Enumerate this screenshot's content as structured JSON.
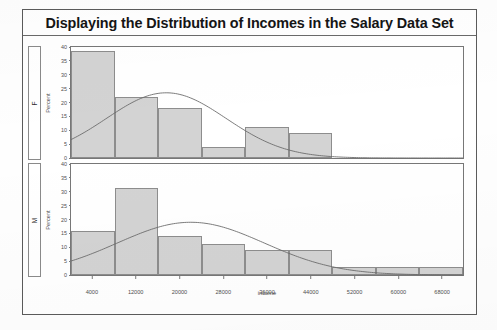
{
  "title": "Displaying the Distribution of Incomes in the Salary Data Set",
  "axis": {
    "x_title": "income",
    "y_title_f": "Percent",
    "y_title_m": "Percent"
  },
  "panel_labels": {
    "female": "F",
    "male": "M"
  },
  "colors": {
    "bar_fill": "#d3d3d3",
    "bar_border": "#8d8d8d",
    "curve": "#6b6b6b",
    "frame": "#5b5b5b",
    "text": "#151515"
  },
  "chart_data": {
    "type": "bar",
    "title": "Displaying the Distribution of Incomes in the Salary Data Set",
    "xlabel": "income",
    "ylabel": "Percent",
    "xlim": [
      0,
      72000
    ],
    "ylim": [
      0,
      40
    ],
    "xticks": [
      4000,
      12000,
      20000,
      28000,
      36000,
      44000,
      52000,
      60000,
      68000
    ],
    "yticks": [
      0,
      5,
      10,
      15,
      20,
      25,
      30,
      35,
      40
    ],
    "grid": false,
    "legend": false,
    "bin_width": 8000,
    "panels": [
      {
        "name": "F",
        "label": "F",
        "bin_centers": [
          4000,
          12000,
          20000,
          28000,
          36000,
          44000
        ],
        "values": [
          38.5,
          22.0,
          18.0,
          4.0,
          11.0,
          9.0
        ],
        "curve": {
          "kind": "normal-density",
          "mean": 17500,
          "std": 11000,
          "peak_percent": 23.5
        }
      },
      {
        "name": "M",
        "label": "M",
        "bin_centers": [
          4000,
          12000,
          20000,
          28000,
          36000,
          44000,
          52000,
          60000,
          68000
        ],
        "values": [
          16.0,
          31.5,
          14.0,
          11.0,
          9.0,
          9.0,
          3.0,
          3.0,
          3.0
        ],
        "curve": {
          "kind": "normal-density",
          "mean": 22000,
          "std": 13500,
          "peak_percent": 19.0
        }
      }
    ]
  }
}
